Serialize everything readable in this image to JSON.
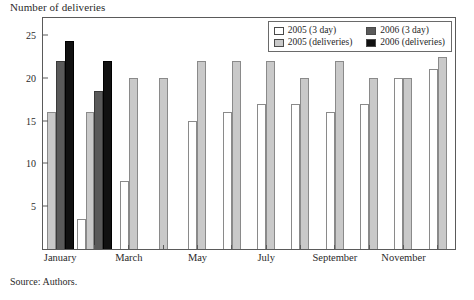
{
  "figure": {
    "y_axis_title": "Number of deliveries",
    "source_note": "Source: Authors."
  },
  "legend": {
    "entries": [
      {
        "label": "2005 (3 day)",
        "color": "#ffffff",
        "key": "s2005_3day"
      },
      {
        "label": "2006 (3 day)",
        "color": "#5a5a5a",
        "key": "s2006_3day"
      },
      {
        "label": "2005 (deliveries)",
        "color": "#c9c9c9",
        "key": "s2005_del"
      },
      {
        "label": "2006 (deliveries)",
        "color": "#111111",
        "key": "s2006_del"
      }
    ]
  },
  "chart_data": {
    "type": "bar",
    "title": "",
    "subtitle": "",
    "xlabel": "",
    "ylabel": "Number of deliveries",
    "ylim": [
      0,
      27
    ],
    "yticks": [
      5,
      10,
      15,
      20,
      25
    ],
    "grid": false,
    "legend_position": "top-right",
    "categories": [
      "January",
      "February",
      "March",
      "April",
      "May",
      "June",
      "July",
      "August",
      "September",
      "October",
      "November",
      "December"
    ],
    "tick_labels": [
      "January",
      "March",
      "May",
      "July",
      "September",
      "November"
    ],
    "tick_label_months": [
      "January",
      "March",
      "May",
      "July",
      "September",
      "November"
    ],
    "series": [
      {
        "name": "2005 (3 day)",
        "color": "#ffffff",
        "values": [
          null,
          3.5,
          8,
          null,
          15,
          16,
          17,
          17,
          16,
          17,
          20,
          21
        ]
      },
      {
        "name": "2005 (deliveries)",
        "color": "#c9c9c9",
        "values": [
          16,
          16,
          20,
          20,
          22,
          22,
          22,
          20,
          22,
          20,
          20,
          22.5
        ]
      },
      {
        "name": "2006 (3 day)",
        "color": "#5a5a5a",
        "values": [
          22,
          18.5,
          null,
          null,
          null,
          null,
          null,
          null,
          null,
          null,
          null,
          null
        ]
      },
      {
        "name": "2006 (deliveries)",
        "color": "#111111",
        "values": [
          24.3,
          22,
          null,
          null,
          null,
          null,
          null,
          null,
          null,
          null,
          null,
          null
        ]
      }
    ],
    "annotations": []
  }
}
